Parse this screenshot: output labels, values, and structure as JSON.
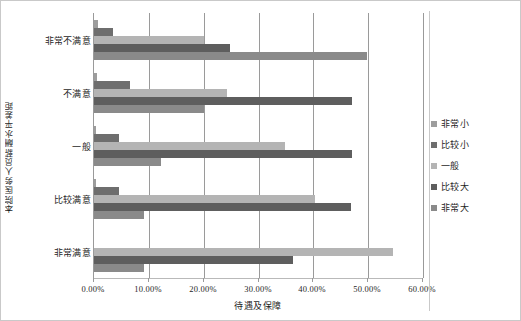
{
  "chart_data": {
    "type": "bar",
    "orientation": "horizontal",
    "grouping": "grouped",
    "title": "",
    "xlabel": "待遇及保障",
    "ylabel": "本院医务人员薪酬水平差距",
    "xlim": [
      0,
      60
    ],
    "xtick_labels": [
      "0.00%",
      "10.00%",
      "20.00%",
      "30.00%",
      "40.00%",
      "50.00%",
      "60.00%"
    ],
    "xtick_values": [
      0,
      10,
      20,
      30,
      40,
      50,
      60
    ],
    "grid": "vertical",
    "legend_position": "right",
    "categories": [
      "非常不满意",
      "不满意",
      "一般",
      "比较满意",
      "非常满意"
    ],
    "series": [
      {
        "name": "非常小",
        "color": "#9d9d9d",
        "values": [
          0.7,
          0.5,
          0.4,
          0.4,
          0.0
        ]
      },
      {
        "name": "比较小",
        "color": "#6e6e6e",
        "values": [
          3.5,
          6.5,
          4.5,
          4.5,
          0.0
        ]
      },
      {
        "name": "一般",
        "color": "#b4b4b4",
        "values": [
          20.0,
          24.3,
          34.8,
          40.3,
          54.5
        ]
      },
      {
        "name": "比较大",
        "color": "#5e5e5e",
        "values": [
          24.8,
          47.0,
          47.0,
          46.8,
          36.3
        ]
      },
      {
        "name": "非常大",
        "color": "#8a8a8a",
        "values": [
          49.8,
          20.0,
          12.3,
          9.2,
          9.2
        ]
      }
    ]
  },
  "legend": {
    "items": [
      {
        "label": "非常小"
      },
      {
        "label": "比较小"
      },
      {
        "label": "一般"
      },
      {
        "label": "比较大"
      },
      {
        "label": "非常大"
      }
    ]
  }
}
